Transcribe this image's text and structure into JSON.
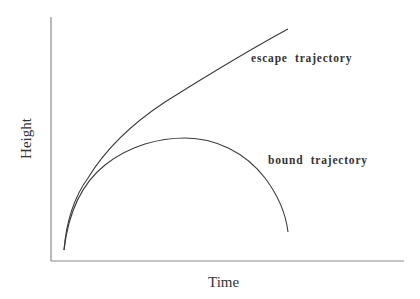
{
  "diagram": {
    "xlabel": "Time",
    "ylabel": "Height",
    "curves": [
      {
        "name": "escape",
        "label": "escape  trajectory"
      },
      {
        "name": "bound",
        "label": "bound  trajectory"
      }
    ],
    "colors": {
      "axis": "#8a8a8a",
      "curve": "#3a3a3a",
      "text": "#333333"
    }
  }
}
